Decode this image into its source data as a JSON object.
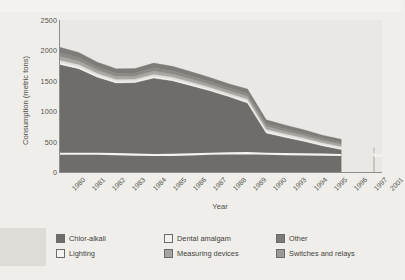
{
  "chart_data": {
    "type": "area",
    "stacked": true,
    "title": "",
    "xlabel": "Year",
    "ylabel": "Consumption (metric tons)",
    "ylim": [
      0,
      2500
    ],
    "yticks": [
      0,
      500,
      1000,
      1500,
      2000,
      2500
    ],
    "grid": false,
    "legend_position": "bottom",
    "categories": [
      "1980",
      "1981",
      "1982",
      "1983",
      "1984",
      "1985",
      "1986",
      "1987",
      "1988",
      "1989",
      "1990",
      "1993",
      "1994",
      "1995",
      "1996",
      "1997",
      "2001"
    ],
    "series": [
      {
        "name": "Chlor-alkali",
        "color": "#6e6d6a",
        "values": [
          1770,
          1700,
          1560,
          1465,
          1470,
          1545,
          1500,
          1420,
          1335,
          1240,
          1135,
          640,
          570,
          505,
          430,
          370,
          260
        ]
      },
      {
        "name": "Lighting",
        "color": "#f2f1ee",
        "values": [
          30,
          30,
          28,
          26,
          26,
          28,
          27,
          26,
          25,
          24,
          30,
          30,
          28,
          26,
          25,
          24,
          22
        ]
      },
      {
        "name": "Dental amalgam",
        "color": "#e2e0dc",
        "values": [
          40,
          38,
          35,
          33,
          33,
          35,
          34,
          33,
          32,
          31,
          34,
          33,
          31,
          30,
          28,
          27,
          24
        ]
      },
      {
        "name": "Measuring devices",
        "color": "#a8a7a3",
        "values": [
          60,
          57,
          53,
          50,
          50,
          53,
          51,
          49,
          47,
          45,
          48,
          45,
          42,
          39,
          36,
          34,
          28
        ]
      },
      {
        "name": "Other",
        "color": "#8b8a86",
        "values": [
          60,
          57,
          53,
          50,
          50,
          53,
          51,
          49,
          47,
          45,
          48,
          45,
          42,
          39,
          36,
          34,
          28
        ]
      },
      {
        "name": "Switches and relays",
        "color": "#7d7c78",
        "values": [
          90,
          85,
          78,
          73,
          73,
          78,
          76,
          72,
          69,
          66,
          70,
          65,
          60,
          56,
          51,
          48,
          40
        ]
      }
    ],
    "annotations": [
      {
        "name": "white-contour-line",
        "description": "light contour line inside chlor-alkali band near 300 metric tons"
      }
    ]
  },
  "axes": {
    "y_title": "Consumption (metric tons)",
    "x_title": "Year",
    "y_ticks": [
      "2500",
      "2000",
      "1500",
      "1000",
      "500",
      "0"
    ],
    "x_ticks": [
      "1980",
      "1981",
      "1982",
      "1983",
      "1984",
      "1985",
      "1986",
      "1987",
      "1988",
      "1989",
      "1990",
      "1993",
      "1994",
      "1995",
      "1996",
      "1997",
      "2001"
    ]
  },
  "legend": {
    "items": [
      {
        "label": "Chlor-alkali",
        "swatch": "#6e6d6a"
      },
      {
        "label": "Dental amalgam",
        "swatch": "#f2f1ee"
      },
      {
        "label": "Other",
        "swatch": "#7b7a76"
      },
      {
        "label": "Lighting",
        "swatch": "#f4f3f0"
      },
      {
        "label": "Measuring devices",
        "swatch": "#a5a4a0"
      },
      {
        "label": "Switches and relays",
        "swatch": "#9b9a96"
      }
    ]
  }
}
